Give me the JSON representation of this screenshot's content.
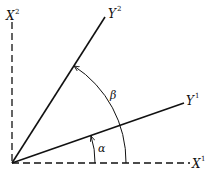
{
  "diagram": {
    "type": "coordinate-rotation",
    "colors": {
      "ink": "#111111",
      "background": "#ffffff"
    },
    "axes": {
      "x1": {
        "base": "X",
        "sup": "1",
        "style": "dashed"
      },
      "x2": {
        "base": "X",
        "sup": "2",
        "style": "dashed"
      },
      "y1": {
        "base": "Y",
        "sup": "1",
        "style": "solid"
      },
      "y2": {
        "base": "Y",
        "sup": "2",
        "style": "solid"
      }
    },
    "angles": {
      "alpha": {
        "symbol": "α",
        "from": "X1",
        "to": "Y1"
      },
      "beta": {
        "symbol": "β",
        "from": "Y1",
        "to": "Y2"
      }
    }
  }
}
